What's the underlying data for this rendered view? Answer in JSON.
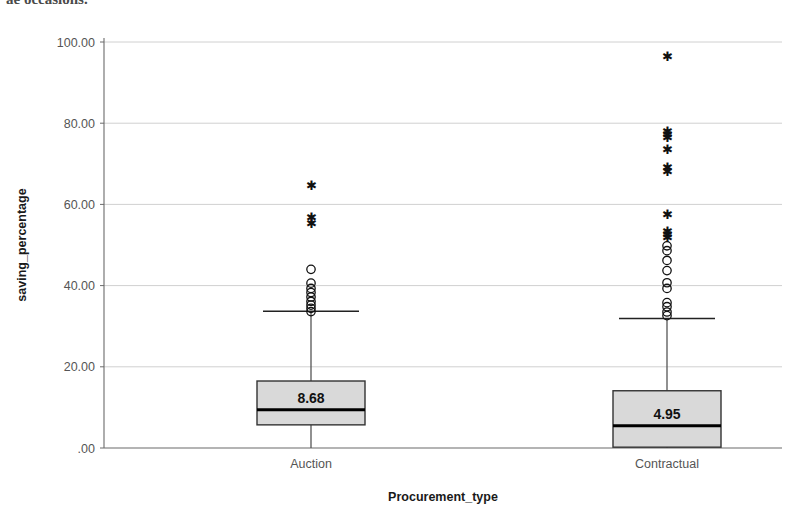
{
  "page": {
    "cropped_header_text": "ae occasions."
  },
  "chart_data": {
    "type": "box",
    "title": "",
    "xlabel": "Procurement_type",
    "ylabel": "saving_percentage",
    "categories": [
      "Auction",
      "Contractual"
    ],
    "ylim": [
      0,
      100
    ],
    "yticks": [
      0,
      20,
      40,
      60,
      80,
      100
    ],
    "ytick_labels": [
      ".00",
      "20.00",
      "40.00",
      "60.00",
      "80.00",
      "100.00"
    ],
    "grid": "horizontal",
    "legend": "none",
    "box_fill_color": "#d9d9d9",
    "box_line_color": "#333333",
    "median_line_color": "#000000",
    "gridline_color": "#d0d0d0",
    "boxes": [
      {
        "name": "Auction",
        "median": 9.4,
        "median_label": "8.68",
        "q1": 5.7,
        "q3": 16.5,
        "whisker_low": 0.0,
        "whisker_high": 33.7,
        "outliers_circle": [
          44.0,
          40.6,
          39.3,
          38.3,
          37.2,
          36.1,
          35.2,
          34.4,
          33.6
        ],
        "outliers_star": [
          64.6,
          56.8,
          55.3
        ]
      },
      {
        "name": "Contractual",
        "median": 5.5,
        "median_label": "4.95",
        "q1": 0.2,
        "q3": 14.1,
        "whisker_low": 0.0,
        "whisker_high": 31.9,
        "outliers_circle": [
          49.8,
          48.6,
          46.2,
          43.7,
          40.7,
          39.3,
          35.8,
          34.8,
          33.5,
          32.6
        ],
        "outliers_star": [
          96.5,
          78.0,
          77.3,
          76.6,
          73.4,
          69.0,
          68.0,
          57.6,
          53.4,
          52.6,
          51.8
        ]
      }
    ]
  }
}
